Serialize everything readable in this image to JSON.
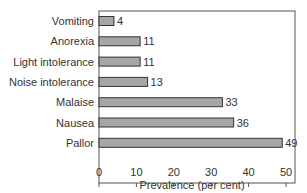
{
  "chart_data": {
    "type": "bar",
    "orientation": "horizontal",
    "title": "",
    "xlabel": "Prevalence (per cent)",
    "ylabel": "",
    "categories": [
      "Vomiting",
      "Anorexia",
      "Light intolerance",
      "Noise intolerance",
      "Malaise",
      "Nausea",
      "Pallor"
    ],
    "values": [
      4,
      11,
      11,
      13,
      33,
      36,
      49
    ],
    "data_labels": [
      "4",
      "11",
      "11",
      "13",
      "33",
      "36",
      "49"
    ],
    "xlim": [
      0,
      52
    ],
    "xticks": [
      0,
      10,
      20,
      30,
      40,
      50
    ],
    "xtick_labels": [
      "0",
      "10",
      "20",
      "30",
      "40",
      "50"
    ],
    "grid": false,
    "legend": null,
    "colors": {
      "bar_fill": "#a6a6a6",
      "bar_stroke": "#333333",
      "frame": "#555555"
    }
  }
}
